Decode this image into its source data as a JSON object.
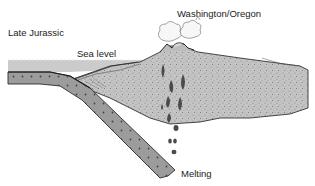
{
  "diagram": {
    "labels": {
      "era": "Late Jurassic",
      "sea_level": "Sea level",
      "region": "Washington/Oregon",
      "melting": "Melting"
    },
    "components": [
      "ocean-water",
      "subducting-oceanic-plate",
      "continental-crust",
      "accretionary-wedge",
      "volcano",
      "eruption-clouds",
      "rising-magma-blobs"
    ],
    "colors": {
      "ocean": "#c8c8c8",
      "oceanic_plate": "#9a9a9a",
      "plate_dots": "#555555",
      "continental_crust": "#bdbdbd",
      "outline": "#333333",
      "magma": "#4a4a4a",
      "background": "#ffffff"
    }
  }
}
